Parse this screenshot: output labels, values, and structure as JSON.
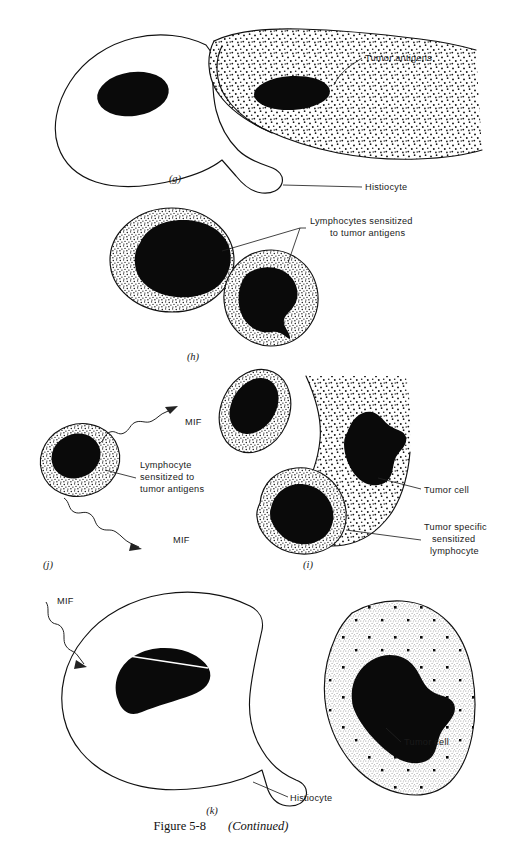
{
  "figure": {
    "caption_label": "Figure 5-8",
    "caption_continued": "(Continued)"
  },
  "panels": [
    {
      "id": "g",
      "letter": "(g)",
      "letter_x": 175,
      "letter_y": 182,
      "labels": [
        {
          "name": "tumor-antigens",
          "text": "Tumor antigens",
          "x": 365,
          "y": 61,
          "anchor": "start"
        },
        {
          "name": "histiocyte",
          "text": "Histiocyte",
          "x": 365,
          "y": 190,
          "anchor": "start"
        }
      ]
    },
    {
      "id": "h",
      "letter": "(h)",
      "letter_x": 193,
      "letter_y": 360,
      "labels": [
        {
          "name": "lymphocytes-sensitized-line1",
          "text": "Lymphocytes sensitized",
          "x": 310,
          "y": 224,
          "anchor": "start"
        },
        {
          "name": "lymphocytes-sensitized-line2",
          "text": "to tumor antigens",
          "x": 330,
          "y": 236,
          "anchor": "start"
        }
      ]
    },
    {
      "id": "j",
      "letter": "(j)",
      "letter_x": 48,
      "letter_y": 568,
      "labels": [
        {
          "name": "mif-upper",
          "text": "MIF",
          "x": 185,
          "y": 425,
          "anchor": "start"
        },
        {
          "name": "mif-lower",
          "text": "MIF",
          "x": 173,
          "y": 543,
          "anchor": "start"
        },
        {
          "name": "lymphocyte-sensitized-line1",
          "text": "Lymphocyte",
          "x": 140,
          "y": 468,
          "anchor": "start"
        },
        {
          "name": "lymphocyte-sensitized-line2",
          "text": "sensitized to",
          "x": 140,
          "y": 480,
          "anchor": "start"
        },
        {
          "name": "lymphocyte-sensitized-line3",
          "text": "tumor antigens",
          "x": 140,
          "y": 492,
          "anchor": "start"
        }
      ]
    },
    {
      "id": "i",
      "letter": "(i)",
      "letter_x": 308,
      "letter_y": 568,
      "labels": [
        {
          "name": "tumor-cell-i",
          "text": "Tumor cell",
          "x": 424,
          "y": 493,
          "anchor": "start"
        },
        {
          "name": "tumor-specific-line1",
          "text": "Tumor specific",
          "x": 424,
          "y": 530,
          "anchor": "start"
        },
        {
          "name": "tumor-specific-line2",
          "text": "sensitized",
          "x": 432,
          "y": 542,
          "anchor": "start"
        },
        {
          "name": "tumor-specific-line3",
          "text": "lymphocyte",
          "x": 430,
          "y": 554,
          "anchor": "start"
        }
      ]
    },
    {
      "id": "k",
      "letter": "(k)",
      "letter_x": 212,
      "letter_y": 814,
      "labels": [
        {
          "name": "mif-k",
          "text": "MIF",
          "x": 57,
          "y": 604,
          "anchor": "start"
        },
        {
          "name": "tumor-cell-k",
          "text": "Tumor cell",
          "x": 404,
          "y": 745,
          "anchor": "start"
        },
        {
          "name": "histiocyte-k",
          "text": "Histiocyte",
          "x": 290,
          "y": 801,
          "anchor": "start"
        }
      ]
    }
  ],
  "colors": {
    "ink": "#111111",
    "nucleus": "#0a0a0a",
    "paper": "#ffffff"
  }
}
